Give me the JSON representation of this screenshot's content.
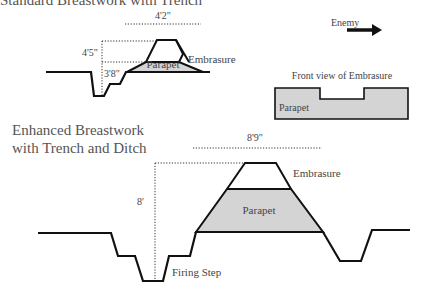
{
  "diagram": {
    "top_section": {
      "title": "Standard Breastwork with Trench",
      "dimensions": {
        "width": "4'2\"",
        "height_outer": "4'5\"",
        "height_inner": "3'8\""
      },
      "labels": {
        "embrasure": "Embrasure",
        "parapet": "Parapet"
      }
    },
    "enemy": {
      "label": "Enemy",
      "icon": "arrow-right-icon"
    },
    "front_view": {
      "title": "Front view of Embrasure",
      "parapet_label": "Parapet"
    },
    "bottom_section": {
      "title_line1": "Enhanced Breastwork",
      "title_line2": "with Trench and Ditch",
      "dimensions": {
        "width": "8'9\"",
        "height": "8'"
      },
      "labels": {
        "embrasure": "Embrasure",
        "parapet": "Parapet",
        "firing_step": "Firing Step"
      }
    },
    "colors": {
      "parapet_fill": "#d4d4d4",
      "line": "#111111",
      "text": "#444444"
    }
  }
}
